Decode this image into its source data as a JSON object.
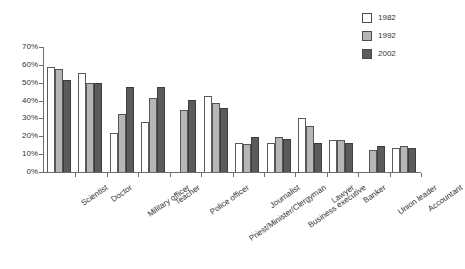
{
  "chart_data": {
    "type": "bar",
    "title": "",
    "subtitle": "",
    "xlabel": "",
    "ylabel": "",
    "ylim": [
      0,
      70
    ],
    "ytick_values": [
      0,
      10,
      20,
      30,
      40,
      50,
      60,
      70
    ],
    "ytick_labels": [
      "0%",
      "10%",
      "20%",
      "30%",
      "40%",
      "50%",
      "60%",
      "70%"
    ],
    "grid": false,
    "legend_position": "top-right",
    "categories": [
      "Scientist",
      "Doctor",
      "Military officer",
      "Teacher",
      "Police officer",
      "Priest/Minister/Clergyman",
      "Journalist",
      "Business executive",
      "Lawyer",
      "Banker",
      "Union leader",
      "Accountant"
    ],
    "series": [
      {
        "name": "1982",
        "color": "#ffffff",
        "values": [
          59,
          55.5,
          22,
          28,
          null,
          42.5,
          16.5,
          16.5,
          30.5,
          18,
          null,
          13.5
        ]
      },
      {
        "name": "1992",
        "color": "#b6b6b6",
        "values": [
          57.5,
          50,
          32.5,
          41.5,
          34.5,
          38.5,
          15.5,
          19.5,
          26,
          18,
          12.5,
          14.5
        ]
      },
      {
        "name": "2002",
        "color": "#5b5b5b",
        "values": [
          51.5,
          50,
          47.5,
          47.5,
          40.5,
          36,
          19.5,
          18.5,
          16,
          16,
          14.5,
          13.5
        ]
      }
    ]
  },
  "legend": {
    "items": [
      {
        "label": "1982",
        "swatch": "legend-swatch-1982"
      },
      {
        "label": "1992",
        "swatch": "legend-swatch-1992"
      },
      {
        "label": "2002",
        "swatch": "legend-swatch-2002"
      }
    ]
  }
}
